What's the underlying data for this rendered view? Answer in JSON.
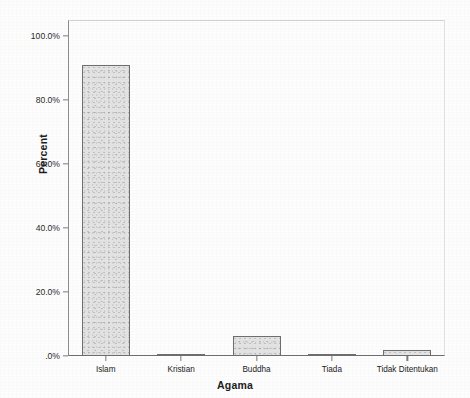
{
  "chart_data": {
    "type": "bar",
    "title": "",
    "subtitle": "",
    "xlabel": "Agama",
    "ylabel": "Percent",
    "categories": [
      "Islam",
      "Kristian",
      "Buddha",
      "Tiada",
      "Tidak Ditentukan"
    ],
    "values": [
      91.0,
      0.3,
      6.2,
      0.2,
      2.0
    ],
    "value_labels": [
      "91.0%",
      "0.3%",
      "6.2%",
      "0.2%",
      "2.0%"
    ],
    "ylim": [
      0,
      105
    ],
    "y_ticks": [
      0,
      20,
      40,
      60,
      80,
      100
    ],
    "y_tick_labels": [
      ".0%",
      "20.0%",
      "40.0%",
      "60.0%",
      "80.0%",
      "100.0%"
    ],
    "grid": false,
    "legend": "none",
    "series": [
      {
        "name": "Percent",
        "values": [
          91.0,
          0.3,
          6.2,
          0.2,
          2.0
        ]
      }
    ],
    "colors": {
      "bar_fill": "#e3e3e3",
      "bar_border": "#6e6e6e",
      "axis": "#7b7b7b",
      "text": "#1d1d1d",
      "background": "#fdfdfd"
    }
  }
}
